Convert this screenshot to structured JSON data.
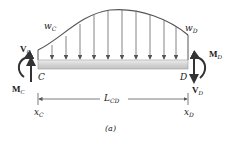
{
  "figure": {
    "caption": "(a)",
    "load_labels": {
      "left": {
        "base": "w",
        "sub": "C"
      },
      "right": {
        "base": "w",
        "sub": "D"
      }
    },
    "shear_labels": {
      "left": {
        "base": "V",
        "sub": "C"
      },
      "right": {
        "base": "V",
        "sub": "D"
      }
    },
    "moment_labels": {
      "left": {
        "base": "M",
        "sub": "C"
      },
      "right": {
        "base": "M",
        "sub": "D"
      }
    },
    "point_labels": {
      "left": "C",
      "right": "D"
    },
    "length_label": {
      "base": "L",
      "sub": "CD"
    },
    "position_labels": {
      "left": {
        "base": "x",
        "sub": "C"
      },
      "right": {
        "base": "x",
        "sub": "D"
      }
    },
    "colors": {
      "beam": "#d9d9d9",
      "lines": "#555555",
      "arrows": "#444444"
    }
  }
}
